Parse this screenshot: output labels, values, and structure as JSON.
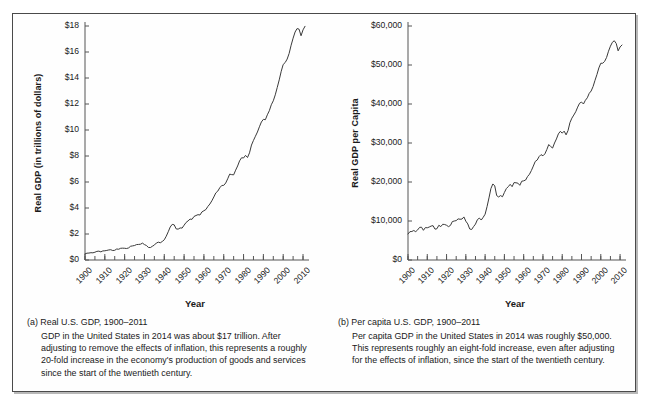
{
  "figure": {
    "panels": [
      {
        "key": "a",
        "caption_head": "(a) Real U.S. GDP, 1900–2011",
        "caption_body": "GDP in the United States in 2014 was about $17 trillion. After adjusting to remove the effects of inflation, this represents a roughly 20-fold increase in the economy's production of goods and services since the start of the twentieth century."
      },
      {
        "key": "b",
        "caption_head": "(b) Per capita U.S. GDP, 1900–2011",
        "caption_body": "Per capita GDP in the United States in 2014 was roughly $50,000. This represents roughly an eight-fold increase, even after adjusting for the effects of inflation, since the start of the twentieth century."
      }
    ]
  },
  "chart_data": [
    {
      "type": "line",
      "title": "",
      "xlabel": "Year",
      "ylabel": "Real GDP (in trillions of dollars)",
      "xlim": [
        1900,
        2011
      ],
      "ylim": [
        0,
        18
      ],
      "grid": false,
      "legend": null,
      "ytick_labels": [
        "$18",
        "$16",
        "$14",
        "$12",
        "$10",
        "$8",
        "$6",
        "$4",
        "$2",
        "$0"
      ],
      "ytick_values": [
        18,
        16,
        14,
        12,
        10,
        8,
        6,
        4,
        2,
        0
      ],
      "xtick_labels": [
        "1900",
        "1910",
        "1920",
        "1930",
        "1940",
        "1950",
        "1960",
        "1970",
        "1980",
        "1990",
        "2000",
        "2010"
      ],
      "xtick_values": [
        1900,
        1910,
        1920,
        1930,
        1940,
        1950,
        1960,
        1970,
        1980,
        1990,
        2000,
        2010
      ],
      "minor_tick_step": 5,
      "line_color": "#3a3a3a",
      "x": [
        1900,
        1901,
        1902,
        1903,
        1904,
        1905,
        1906,
        1907,
        1908,
        1909,
        1910,
        1911,
        1912,
        1913,
        1914,
        1915,
        1916,
        1917,
        1918,
        1919,
        1920,
        1921,
        1922,
        1923,
        1924,
        1925,
        1926,
        1927,
        1928,
        1929,
        1930,
        1931,
        1932,
        1933,
        1934,
        1935,
        1936,
        1937,
        1938,
        1939,
        1940,
        1941,
        1942,
        1943,
        1944,
        1945,
        1946,
        1947,
        1948,
        1949,
        1950,
        1951,
        1952,
        1953,
        1954,
        1955,
        1956,
        1957,
        1958,
        1959,
        1960,
        1961,
        1962,
        1963,
        1964,
        1965,
        1966,
        1967,
        1968,
        1969,
        1970,
        1971,
        1972,
        1973,
        1974,
        1975,
        1976,
        1977,
        1978,
        1979,
        1980,
        1981,
        1982,
        1983,
        1984,
        1985,
        1986,
        1987,
        1988,
        1989,
        1990,
        1991,
        1992,
        1993,
        1994,
        1995,
        1996,
        1997,
        1998,
        1999,
        2000,
        2001,
        2002,
        2003,
        2004,
        2005,
        2006,
        2007,
        2008,
        2009,
        2010,
        2011
      ],
      "y": [
        0.51,
        0.57,
        0.58,
        0.61,
        0.6,
        0.65,
        0.72,
        0.74,
        0.68,
        0.76,
        0.77,
        0.8,
        0.84,
        0.86,
        0.79,
        0.81,
        0.92,
        0.9,
        0.98,
        0.99,
        0.98,
        0.96,
        1.01,
        1.15,
        1.18,
        1.21,
        1.29,
        1.3,
        1.32,
        1.41,
        1.29,
        1.21,
        1.05,
        1.04,
        1.15,
        1.25,
        1.42,
        1.49,
        1.44,
        1.55,
        1.69,
        1.99,
        2.36,
        2.76,
        2.98,
        2.94,
        2.6,
        2.58,
        2.68,
        2.67,
        2.91,
        3.14,
        3.27,
        3.42,
        3.4,
        3.64,
        3.72,
        3.79,
        3.76,
        4.02,
        4.12,
        4.22,
        4.48,
        4.68,
        4.95,
        5.27,
        5.61,
        5.76,
        6.04,
        6.23,
        6.24,
        6.44,
        6.79,
        7.18,
        7.14,
        7.12,
        7.51,
        7.86,
        8.29,
        8.55,
        8.53,
        8.75,
        8.57,
        8.96,
        9.61,
        10.0,
        10.35,
        10.7,
        11.14,
        11.54,
        11.76,
        11.73,
        12.14,
        12.48,
        12.98,
        13.31,
        13.81,
        14.43,
        15.06,
        15.78,
        16.35,
        16.51,
        16.8,
        17.27,
        17.96,
        18.55,
        19.06,
        19.35,
        19.3,
        18.75,
        19.24,
        19.54
      ],
      "y_display_scale": 0.92,
      "notes": "Slow growth 1900-1930, Depression dip early 1930s, WWII surge peaking ~1944, post-war dip 1946, sustained expansion thereafter, recession dips 1974-75, 1982, 1991, 2001, and 2008-2009; ends ~$17.5 trillion in 2011."
    },
    {
      "type": "line",
      "title": "",
      "xlabel": "Year",
      "ylabel": "Real GDP per Capita",
      "xlim": [
        1900,
        2011
      ],
      "ylim": [
        0,
        60000
      ],
      "grid": false,
      "legend": null,
      "ytick_labels": [
        "$60,000",
        "$50,000",
        "$40,000",
        "$30,000",
        "$20,000",
        "$10,000",
        "$0"
      ],
      "ytick_values": [
        60000,
        50000,
        40000,
        30000,
        20000,
        10000,
        0
      ],
      "xtick_labels": [
        "1900",
        "1910",
        "1920",
        "1930",
        "1940",
        "1950",
        "1960",
        "1970",
        "1980",
        "1990",
        "2000",
        "2010"
      ],
      "xtick_values": [
        1900,
        1910,
        1920,
        1930,
        1940,
        1950,
        1960,
        1970,
        1980,
        1990,
        2000,
        2010
      ],
      "minor_tick_step": 5,
      "line_color": "#3a3a3a",
      "x": [
        1900,
        1901,
        1902,
        1903,
        1904,
        1905,
        1906,
        1907,
        1908,
        1909,
        1910,
        1911,
        1912,
        1913,
        1914,
        1915,
        1916,
        1917,
        1918,
        1919,
        1920,
        1921,
        1922,
        1923,
        1924,
        1925,
        1926,
        1927,
        1928,
        1929,
        1930,
        1931,
        1932,
        1933,
        1934,
        1935,
        1936,
        1937,
        1938,
        1939,
        1940,
        1941,
        1942,
        1943,
        1944,
        1945,
        1946,
        1947,
        1948,
        1949,
        1950,
        1951,
        1952,
        1953,
        1954,
        1955,
        1956,
        1957,
        1958,
        1959,
        1960,
        1961,
        1962,
        1963,
        1964,
        1965,
        1966,
        1967,
        1968,
        1969,
        1970,
        1971,
        1972,
        1973,
        1974,
        1975,
        1976,
        1977,
        1978,
        1979,
        1980,
        1981,
        1982,
        1983,
        1984,
        1985,
        1986,
        1987,
        1988,
        1989,
        1990,
        1991,
        1992,
        1993,
        1994,
        1995,
        1996,
        1997,
        1998,
        1999,
        2000,
        2001,
        2002,
        2003,
        2004,
        2005,
        2006,
        2007,
        2008,
        2009,
        2010,
        2011
      ],
      "y": [
        6700,
        7300,
        7350,
        7600,
        7300,
        7750,
        8400,
        8450,
        7650,
        8350,
        8300,
        8500,
        8750,
        8850,
        7950,
        8050,
        8950,
        8600,
        9200,
        9150,
        8950,
        8600,
        8900,
        9900,
        10050,
        10150,
        10600,
        10500,
        10550,
        11100,
        10000,
        9300,
        8000,
        7850,
        8600,
        9250,
        10400,
        10800,
        10300,
        11000,
        11800,
        13750,
        16000,
        18400,
        19600,
        19100,
        16600,
        16250,
        16600,
        16300,
        17400,
        18400,
        18900,
        19500,
        18900,
        19950,
        19900,
        19800,
        19250,
        20300,
        20400,
        20600,
        21500,
        22100,
        23050,
        24200,
        25400,
        25750,
        26650,
        27150,
        26850,
        27350,
        28450,
        29750,
        29250,
        28850,
        30150,
        31200,
        32500,
        33150,
        32700,
        33200,
        32250,
        33350,
        35400,
        36550,
        37350,
        38200,
        39400,
        40400,
        40700,
        40200,
        41150,
        41800,
        42950,
        43550,
        44700,
        46300,
        47800,
        49500,
        50700,
        50700,
        51200,
        52200,
        53800,
        55100,
        56100,
        56500,
        55800,
        53900,
        54900,
        55400
      ],
      "y_display_scale": 0.995,
      "notes": "Roughly flat ~$7,000-$10,000 from 1900 to 1930, sharp Depression trough early 1930s, WWII spike to ~$19,000 in 1944, post-war drop to ~$16,000, then steady climb with recession dips; ends ~$55,000 in 2011."
    }
  ]
}
